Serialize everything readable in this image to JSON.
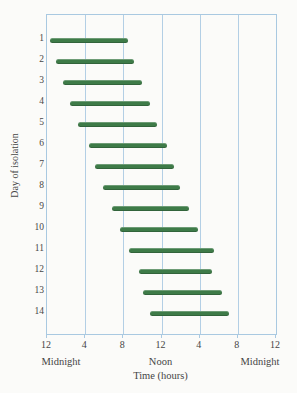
{
  "figure": {
    "background": "#fbfbf9",
    "bar_color": "#3e7b48",
    "grid_color": "#b3cfe5",
    "border_color": "#a9c9e1",
    "text_color": "#454545"
  },
  "chart_data": {
    "type": "bar",
    "subtype": "horizontal-range-bars",
    "title": "",
    "xlabel": "Time (hours)",
    "ylabel": "Day of isolation",
    "xlim_hours": [
      0,
      24
    ],
    "grid": "vertical-only",
    "x_ticks": [
      {
        "hour": 0,
        "label": "12"
      },
      {
        "hour": 4,
        "label": "4"
      },
      {
        "hour": 8,
        "label": "8"
      },
      {
        "hour": 12,
        "label": "12"
      },
      {
        "hour": 16,
        "label": "4"
      },
      {
        "hour": 20,
        "label": "8"
      },
      {
        "hour": 24,
        "label": "12"
      }
    ],
    "x_sublabels": [
      {
        "hour": 0,
        "label": "Midnight"
      },
      {
        "hour": 12,
        "label": "Noon"
      },
      {
        "hour": 24,
        "label": "Midnight"
      }
    ],
    "bars": [
      {
        "day": 1,
        "start_hour": 0.3,
        "end_hour": 8.5
      },
      {
        "day": 2,
        "start_hour": 0.9,
        "end_hour": 9.1
      },
      {
        "day": 3,
        "start_hour": 1.7,
        "end_hour": 10.0
      },
      {
        "day": 4,
        "start_hour": 2.4,
        "end_hour": 10.8
      },
      {
        "day": 5,
        "start_hour": 3.2,
        "end_hour": 11.5
      },
      {
        "day": 6,
        "start_hour": 4.4,
        "end_hour": 12.6
      },
      {
        "day": 7,
        "start_hour": 5.0,
        "end_hour": 13.3
      },
      {
        "day": 8,
        "start_hour": 5.9,
        "end_hour": 13.9
      },
      {
        "day": 9,
        "start_hour": 6.8,
        "end_hour": 14.9
      },
      {
        "day": 10,
        "start_hour": 7.6,
        "end_hour": 15.8
      },
      {
        "day": 11,
        "start_hour": 8.6,
        "end_hour": 17.5
      },
      {
        "day": 12,
        "start_hour": 9.6,
        "end_hour": 17.3
      },
      {
        "day": 13,
        "start_hour": 10.1,
        "end_hour": 18.3
      },
      {
        "day": 14,
        "start_hour": 10.8,
        "end_hour": 19.1
      }
    ]
  }
}
